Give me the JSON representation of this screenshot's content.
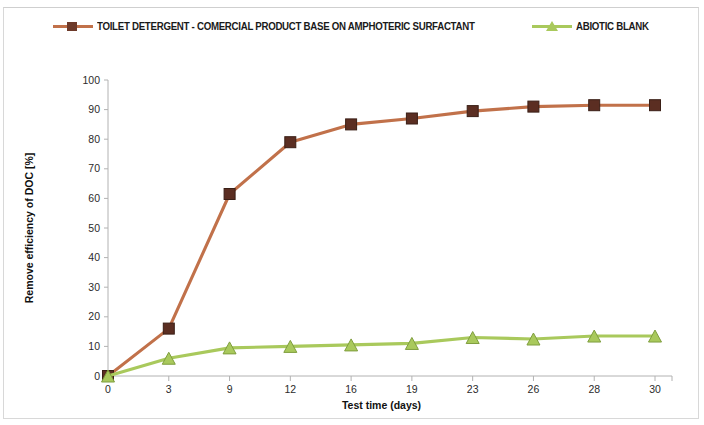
{
  "chart_data": {
    "type": "line",
    "title": "",
    "xlabel": "Test time (days)",
    "ylabel": "Remove efficiency of DOC [%]",
    "categories": [
      "0",
      "3",
      "9",
      "12",
      "16",
      "19",
      "23",
      "26",
      "28",
      "30"
    ],
    "x_tick_labels": [
      "0",
      "3",
      "9",
      "12",
      "16",
      "19",
      "23",
      "26",
      "28",
      "30"
    ],
    "y_tick_labels": [
      "0",
      "10",
      "20",
      "30",
      "40",
      "50",
      "60",
      "70",
      "80",
      "90",
      "100"
    ],
    "ylim": [
      0,
      100
    ],
    "y_major_step": 10,
    "grid": false,
    "legend_position": "top-center",
    "series": [
      {
        "name": "TOILET DETERGENT - COMERCIAL PRODUCT BASE ON AMPHOTERIC SURFACTANT",
        "marker": "square",
        "line_color": "#c1714a",
        "marker_color": "#5b2e22",
        "values": [
          0,
          16,
          61.5,
          79,
          85,
          87,
          89.5,
          91,
          91.5,
          91.5
        ]
      },
      {
        "name": "ABIOTIC BLANK",
        "marker": "triangle",
        "line_color": "#a9c95c",
        "marker_color": "#a9c95c",
        "values": [
          0,
          6,
          9.5,
          10,
          10.5,
          11,
          13,
          12.5,
          13.5,
          13.5
        ]
      }
    ]
  },
  "legend": {
    "entries": [
      {
        "label": "TOILET DETERGENT - COMERCIAL PRODUCT BASE ON AMPHOTERIC SURFACTANT",
        "color": "#c1714a"
      },
      {
        "label": "ABIOTIC BLANK",
        "color": "#a9c95c"
      }
    ]
  },
  "axes": {
    "y_title": "Remove efficiency of DOC [%]",
    "x_title": "Test time (days)"
  }
}
